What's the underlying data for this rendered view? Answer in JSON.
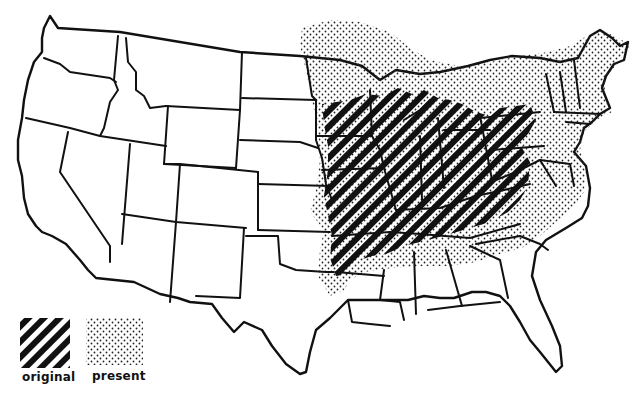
{
  "map": {
    "subject": "Range map of the contiguous United States",
    "colors": {
      "ink": "#111111",
      "background": "#ffffff",
      "dots": "#222222"
    }
  },
  "legend": {
    "items": [
      {
        "key": "original",
        "label": "original",
        "pattern": "diagonal-hatch"
      },
      {
        "key": "present",
        "label": "present",
        "pattern": "stipple-dots"
      }
    ]
  }
}
